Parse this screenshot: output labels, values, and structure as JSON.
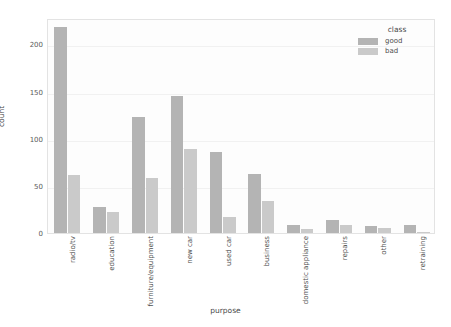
{
  "chart_data": {
    "type": "bar",
    "title": "",
    "xlabel": "purpose",
    "ylabel": "count",
    "ylim": [
      0,
      228
    ],
    "yticks": [
      0,
      50,
      100,
      150,
      200
    ],
    "grid": true,
    "legend_title": "class",
    "legend_position": "upper-right-outside",
    "orientation": "vertical",
    "grouping": "grouped",
    "categories": [
      "radio/tv",
      "education",
      "furniture/equipment",
      "new car",
      "used car",
      "business",
      "domestic appliance",
      "repairs",
      "other",
      "retraining"
    ],
    "series": [
      {
        "name": "good",
        "color": "#b4b4b4",
        "values": [
          218,
          28,
          123,
          145,
          86,
          63,
          8,
          14,
          7,
          8
        ]
      },
      {
        "name": "bad",
        "color": "#cacaca",
        "values": [
          62,
          22,
          58,
          89,
          17,
          34,
          4,
          8,
          5,
          1
        ]
      }
    ]
  },
  "legend": {
    "title": "class",
    "entries": [
      {
        "label": "good",
        "color": "#b4b4b4"
      },
      {
        "label": "bad",
        "color": "#cacaca"
      }
    ]
  },
  "axes": {
    "x_title": "purpose",
    "y_title": "count",
    "y_tick_labels": [
      "0",
      "50",
      "100",
      "150",
      "200"
    ],
    "x_tick_labels": [
      "radio/tv",
      "education",
      "furniture/equipment",
      "new car",
      "used car",
      "business",
      "domestic appliance",
      "repairs",
      "other",
      "retraining"
    ]
  },
  "colors": {
    "good": "#b4b4b4",
    "bad": "#cacaca",
    "grid": "#f1f1f1",
    "frame": "#e3e3e3",
    "text": "#4f4f4f",
    "background": "#ffffff"
  }
}
